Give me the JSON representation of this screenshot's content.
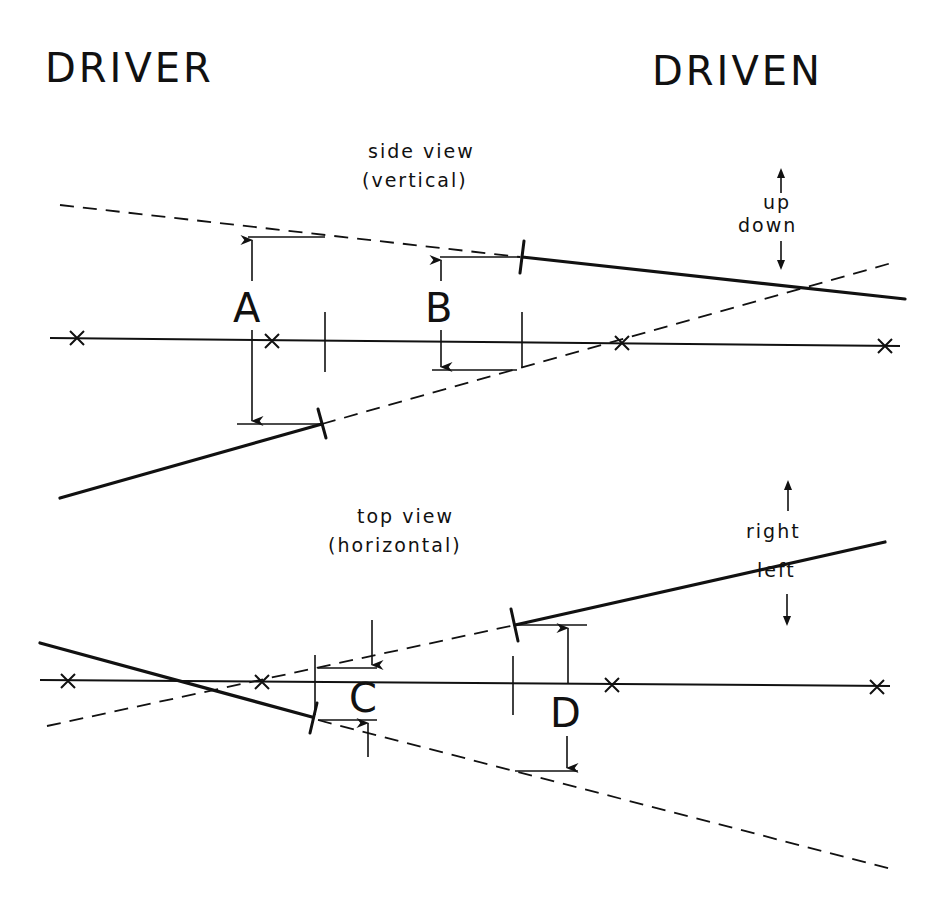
{
  "headers": {
    "driver": "DRIVER",
    "driven": "DRIVEN"
  },
  "side_view": {
    "title_line1": "side view",
    "title_line2": "(vertical)",
    "direction_up": "up",
    "direction_down": "down",
    "dimension_a": "A",
    "dimension_b": "B"
  },
  "top_view": {
    "title_line1": "top view",
    "title_line2": "(horizontal)",
    "direction_right": "right",
    "direction_left": "left",
    "dimension_c": "C",
    "dimension_d": "D"
  },
  "colors": {
    "ink": "#111111",
    "paper": "#ffffff"
  }
}
